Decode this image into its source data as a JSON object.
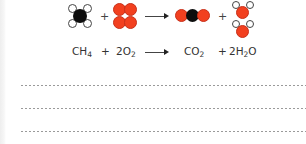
{
  "diagram": {
    "molecules": {
      "reactants": [
        {
          "name": "methane",
          "formula": "CH4",
          "atoms": [
            "C",
            "H",
            "H",
            "H",
            "H"
          ]
        },
        {
          "name": "oxygen",
          "count": 2,
          "formula": "O2",
          "atoms": [
            "O",
            "O"
          ]
        }
      ],
      "products": [
        {
          "name": "carbon-dioxide",
          "formula": "CO2",
          "atoms": [
            "O",
            "C",
            "O"
          ]
        },
        {
          "name": "water",
          "count": 2,
          "formula": "H2O",
          "atoms": [
            "H",
            "O",
            "H"
          ]
        }
      ]
    },
    "colors": {
      "carbon": "#0d0d0d",
      "oxygen": "#f2401f",
      "hydrogen": "#ffffff"
    },
    "symbols": {
      "plus": "+",
      "arrow": "⟶"
    },
    "equation": {
      "r1_main": "CH",
      "r1_sub": "4",
      "plus1": "+",
      "r2_main": "2O",
      "r2_sub": "2",
      "p1_main": "CO",
      "p1_sub": "2",
      "plus2": "+",
      "p2_main1": "2H",
      "p2_sub": "2",
      "p2_main2": "O"
    }
  },
  "answer_lines": {
    "count": 3
  }
}
